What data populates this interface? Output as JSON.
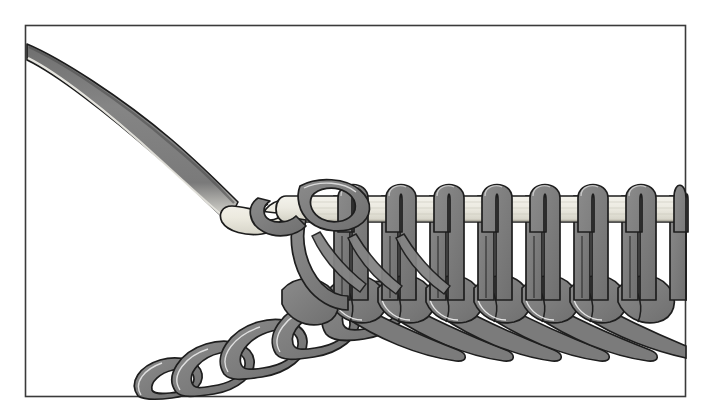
{
  "illustration": {
    "title": "Tunisian crochet hook holding loops",
    "subject": "crochet-hook-with-loops",
    "style": "black-and-white line drawing with flat gray fill",
    "background_color": "#ffffff",
    "frame": {
      "name": "border-rectangle",
      "stroke_color": "#3a3a3a",
      "stroke_width": 1.6,
      "x": 25,
      "y": 25,
      "width": 661,
      "height": 372
    },
    "palette": {
      "yarn_fill": "#7e7e7e",
      "yarn_fill_dark": "#6e6e6e",
      "yarn_fill_light": "#9a9a9a",
      "yarn_outline": "#1e1e1e",
      "hook_fill": "#ebeae2",
      "hook_fill_shadow": "#d8d7cc",
      "hook_handle_fill": "#808080",
      "hook_outline": "#1c1c1c",
      "highlight": "#ffffff"
    },
    "parts": [
      {
        "name": "hook-handle",
        "label": "Hook handle (upper left, tapering diagonal)",
        "from_x": 28,
        "from_y": 48,
        "to_x": 232,
        "to_y": 212
      },
      {
        "name": "hook-head",
        "label": "Hook head with throat and point",
        "tip_x": 228,
        "tip_y": 218,
        "notch_x": 268,
        "notch_y": 214
      },
      {
        "name": "hook-shaft",
        "label": "Long straight shaft carrying the loops",
        "x1": 262,
        "y1": 196,
        "x2": 686,
        "y2": 196,
        "thickness": 26
      },
      {
        "name": "working-loop",
        "label": "Loop held at the hook throat"
      },
      {
        "name": "loops-on-shaft",
        "label": "Vertical loops held on the shaft",
        "count": 8,
        "first_center_x": 352,
        "spacing": 48,
        "top_y": 180,
        "bottom_y": 300
      },
      {
        "name": "foundation-chain",
        "label": "Chain stitches descending to lower left",
        "start_x": 140,
        "start_y": 390,
        "end_x": 400,
        "end_y": 285
      },
      {
        "name": "stitch-row",
        "label": "Completed row of stitches below the shaft"
      },
      {
        "name": "diagonal-strands",
        "label": "Diagonal yarn strands linking loops to the row"
      }
    ]
  }
}
